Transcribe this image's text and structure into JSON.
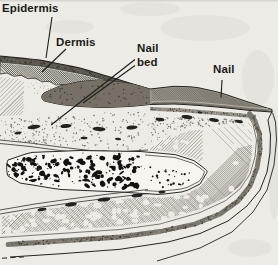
{
  "figure": {
    "type": "anatomical cross-section line drawing",
    "labels": {
      "epidermis": "Epidermis",
      "dermis": "Dermis",
      "nail_bed_line1": "Nail",
      "nail_bed_line2": "bed",
      "nail": "Nail"
    },
    "colors": {
      "ink": "#26241f",
      "paper": "#edebe6"
    }
  }
}
